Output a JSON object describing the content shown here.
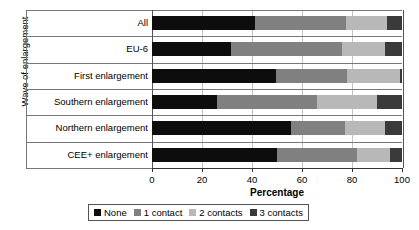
{
  "chart_data": {
    "type": "bar",
    "orientation": "horizontal",
    "stacked": true,
    "stack_normalized_to": 100,
    "title": "",
    "xlabel": "Percentage",
    "ylabel": "Wave of enlargement",
    "xlim": [
      0,
      100
    ],
    "xticks": [
      0,
      20,
      40,
      60,
      80,
      100
    ],
    "xtick_labels": [
      "0",
      "20",
      "40",
      "60",
      "80",
      "100"
    ],
    "grid": "vertical",
    "legend_position": "bottom",
    "categories": [
      "All",
      "EU-6",
      "First enlargement",
      "Southern enlargement",
      "Northern enlargement",
      "CEE+ enlargement"
    ],
    "series": [
      {
        "name": "None",
        "color": "#0d0d0d",
        "values": [
          41.0,
          31.5,
          49.5,
          26.0,
          55.5,
          50.0
        ]
      },
      {
        "name": "1 contact",
        "color": "#808080",
        "values": [
          36.5,
          44.5,
          28.5,
          40.0,
          21.5,
          32.0
        ]
      },
      {
        "name": "2 contacts",
        "color": "#b8b8b8",
        "values": [
          16.5,
          17.0,
          21.0,
          24.0,
          16.0,
          13.0
        ]
      },
      {
        "name": "3 contacts",
        "color": "#3a3a3a",
        "values": [
          6.0,
          7.0,
          1.0,
          10.0,
          7.0,
          5.0
        ]
      }
    ]
  },
  "legend": {
    "items": [
      {
        "label": "None",
        "color": "#0d0d0d"
      },
      {
        "label": "1 contact",
        "color": "#808080"
      },
      {
        "label": "2 contacts",
        "color": "#b8b8b8"
      },
      {
        "label": "3 contacts",
        "color": "#3a3a3a"
      }
    ]
  }
}
